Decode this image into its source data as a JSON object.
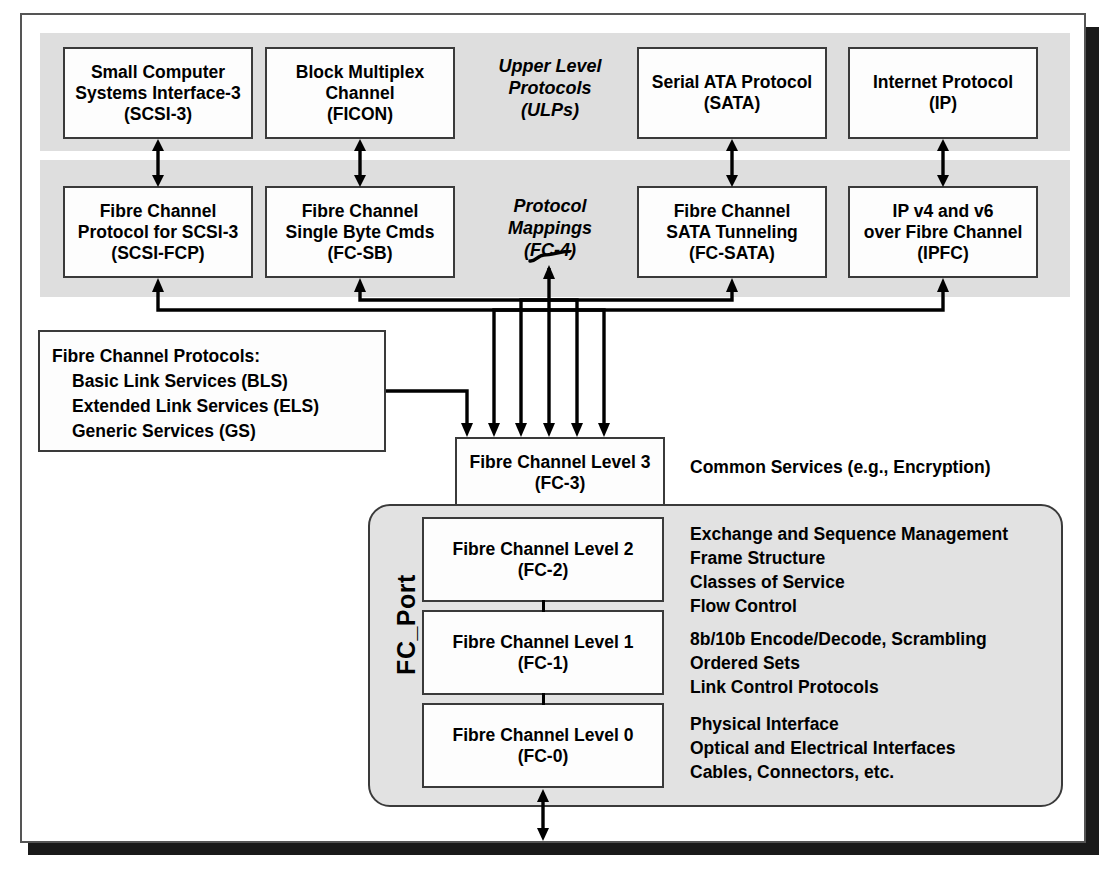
{
  "diagram": {
    "groups": {
      "ulp": {
        "caption_lines": [
          "Upper Level",
          "Protocols",
          "(ULPs)"
        ]
      },
      "fc4": {
        "caption_lines": [
          "Protocol",
          "Mappings",
          "(FC-4)"
        ]
      }
    },
    "ulp_boxes": [
      {
        "name": "scsi3",
        "lines": [
          "Small Computer",
          "Systems Interface-3",
          "(SCSI-3)"
        ]
      },
      {
        "name": "ficon",
        "lines": [
          "Block Multiplex",
          "Channel",
          "(FICON)"
        ]
      },
      {
        "name": "sata",
        "lines": [
          "Serial ATA Protocol",
          "(SATA)"
        ]
      },
      {
        "name": "ip",
        "lines": [
          "Internet Protocol",
          "(IP)"
        ]
      }
    ],
    "fc4_boxes": [
      {
        "name": "scsi-fcp",
        "lines": [
          "Fibre Channel",
          "Protocol for SCSI-3",
          "(SCSI-FCP)"
        ]
      },
      {
        "name": "fc-sb",
        "lines": [
          "Fibre Channel",
          "Single Byte Cmds",
          "(FC-SB)"
        ]
      },
      {
        "name": "fc-sata",
        "lines": [
          "Fibre Channel",
          "SATA Tunneling",
          "(FC-SATA)"
        ]
      },
      {
        "name": "ipfc",
        "lines": [
          "IP v4 and v6",
          "over Fibre Channel",
          "(IPFC)"
        ]
      }
    ],
    "protocols_box": {
      "heading": "Fibre Channel Protocols:",
      "items": [
        "Basic Link Services (BLS)",
        "Extended Link Services (ELS)",
        "Generic Services (GS)"
      ]
    },
    "fc3": {
      "lines": [
        "Fibre Channel Level 3",
        "(FC-3)"
      ],
      "description": "Common Services (e.g., Encryption)"
    },
    "fc_port": {
      "label": "FC_Port",
      "levels": [
        {
          "name": "fc-2",
          "lines": [
            "Fibre Channel Level 2",
            "(FC-2)"
          ],
          "features": [
            "Exchange and Sequence Management",
            "Frame Structure",
            "Classes of Service",
            "Flow Control"
          ]
        },
        {
          "name": "fc-1",
          "lines": [
            "Fibre Channel Level 1",
            "(FC-1)"
          ],
          "features": [
            "8b/10b Encode/Decode, Scrambling",
            "Ordered Sets",
            "Link Control Protocols"
          ]
        },
        {
          "name": "fc-0",
          "lines": [
            "Fibre Channel Level 0",
            "(FC-0)"
          ],
          "features": [
            "Physical Interface",
            "Optical and Electrical Interfaces",
            "Cables, Connectors, etc."
          ]
        }
      ]
    },
    "colors": {
      "band": "#dedede",
      "box_fill": "#fdfdfd",
      "box_border": "#3a3a3a",
      "line": "#000000",
      "shadow": "#1a1a1a",
      "fcport_fill": "#e2e2e2"
    }
  }
}
